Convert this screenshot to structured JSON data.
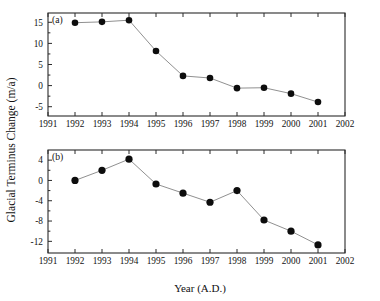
{
  "figure": {
    "xlabel": "Year (A.D.)",
    "ylabel": "Glacial Terminus Change (m/a)",
    "panel_a_tag": "(a)",
    "panel_b_tag": "(b)",
    "marker_color": "#0d0d0d",
    "line_color": "#8a8a8a",
    "axis_color": "#2b2b2b",
    "background": "#ffffff"
  },
  "chart_data": [
    {
      "type": "line",
      "panel": "(a)",
      "title": "",
      "xlabel": "",
      "ylabel": "Glacial Terminus Change (m/a)",
      "x": [
        1992,
        1993,
        1994,
        1995,
        1996,
        1997,
        1998,
        1999,
        2000,
        2001
      ],
      "values": [
        14.9,
        15.1,
        15.5,
        8.2,
        2.3,
        1.8,
        -0.6,
        -0.5,
        -1.9,
        -3.9
      ],
      "xlim": [
        1991,
        2002
      ],
      "ylim": [
        -7.2,
        17.2
      ],
      "xticks": [
        1991,
        1992,
        1993,
        1994,
        1995,
        1996,
        1997,
        1998,
        1999,
        2000,
        2001,
        2002
      ],
      "xticklabels": [
        "1991",
        "1992",
        "1993",
        "1994",
        "1995",
        "1996",
        "1997",
        "1998",
        "1999",
        "2000",
        "2001",
        "2002"
      ],
      "yticks": [
        -5,
        0,
        5,
        10,
        15
      ],
      "yticklabels": [
        "-5",
        "0",
        "5",
        "10",
        "15"
      ],
      "grid": false,
      "legend": "none",
      "marker": "filled-circle"
    },
    {
      "type": "line",
      "panel": "(b)",
      "title": "",
      "xlabel": "Year (A.D.)",
      "ylabel": "Glacial Terminus Change (m/a)",
      "x": [
        1992,
        1993,
        1994,
        1995,
        1996,
        1997,
        1998,
        1999,
        2000,
        2001
      ],
      "values": [
        0.0,
        2.0,
        4.2,
        -0.7,
        -2.5,
        -4.3,
        -2.0,
        -7.8,
        -10.0,
        -12.7
      ],
      "xlim": [
        1991,
        2002
      ],
      "ylim": [
        -14.3,
        6.0
      ],
      "xticks": [
        1991,
        1992,
        1993,
        1994,
        1995,
        1996,
        1997,
        1998,
        1999,
        2000,
        2001,
        2002
      ],
      "xticklabels": [
        "1991",
        "1992",
        "1993",
        "1994",
        "1995",
        "1996",
        "1997",
        "1998",
        "1999",
        "2000",
        "2001",
        "2002"
      ],
      "yticks": [
        -12,
        -8,
        -4,
        0,
        4
      ],
      "yticklabels": [
        "-12",
        "-8",
        "-4",
        "0",
        "4"
      ],
      "grid": false,
      "legend": "none",
      "marker": "filled-circle"
    }
  ]
}
